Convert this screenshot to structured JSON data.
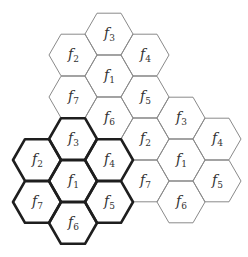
{
  "diagram": {
    "title": "",
    "hex_side": 24,
    "cell_offsets": {
      "f1": [
        0,
        0
      ],
      "f2": [
        -36,
        -21
      ],
      "f3": [
        0,
        -42
      ],
      "f4": [
        36,
        -21
      ],
      "f5": [
        36,
        21
      ],
      "f6": [
        0,
        42
      ],
      "f7": [
        -36,
        21
      ]
    },
    "clusters": [
      {
        "name": "top-cluster",
        "center": [
          109,
          76
        ],
        "style": "thin",
        "cells": [
          "f1",
          "f2",
          "f3",
          "f4",
          "f5",
          "f6",
          "f7"
        ]
      },
      {
        "name": "right-cluster",
        "center": [
          181,
          160
        ],
        "style": "thin",
        "cells": [
          "f1",
          "f2",
          "f3",
          "f4",
          "f5",
          "f6",
          "f7"
        ]
      },
      {
        "name": "bold-cluster",
        "center": [
          73,
          181
        ],
        "style": "bold",
        "cells": [
          "f1",
          "f2",
          "f3",
          "f4",
          "f5",
          "f6",
          "f7"
        ]
      }
    ],
    "label_letter": "f",
    "colors": {
      "thin_stroke": "#8a8a8a",
      "bold_stroke": "#1e1e1e",
      "text": "#333333"
    }
  }
}
